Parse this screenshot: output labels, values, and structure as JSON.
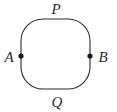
{
  "figure": {
    "kind": "geometry-diagram",
    "background_color": "#ffffff",
    "stroke_color": "#2b2b2b",
    "stroke_width": 1.1,
    "point_color": "#1a1a1a",
    "point_radius": 2.6,
    "label_color": "#2b2b2b",
    "curve": {
      "name": "closed-squircle",
      "left_x": 21,
      "right_x": 90,
      "top_y": 19,
      "bottom_y": 89,
      "corner_radius": 22
    },
    "points": [
      {
        "id": "A",
        "label": "A",
        "cx": 21,
        "cy": 56
      },
      {
        "id": "B",
        "label": "B",
        "cx": 90,
        "cy": 56
      }
    ],
    "arc_labels": [
      {
        "id": "P",
        "label": "P",
        "position": "top",
        "x": 56,
        "y": 9
      },
      {
        "id": "Q",
        "label": "Q",
        "position": "bottom",
        "x": 57,
        "y": 102
      }
    ]
  }
}
